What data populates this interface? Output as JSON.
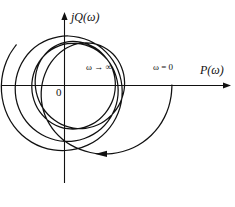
{
  "figure": {
    "kind": "nyquist-polar-plot",
    "background_color": "#ffffff",
    "stroke_color": "#111111"
  },
  "axes": {
    "imaginary": {
      "label": "jQ(ω)",
      "icon": "up-arrow-axis",
      "x_px": 64,
      "top_px": 12,
      "bottom_px": 183
    },
    "real": {
      "label": "P(ω)",
      "icon": "right-arrow-axis",
      "y_px": 85,
      "left_px": 2,
      "right_px": 230
    },
    "origin": {
      "label": "0",
      "x_px": 64,
      "y_px": 85
    }
  },
  "annotations": {
    "omega_start": "ω = 0",
    "omega_end": "ω → ∞",
    "direction_arrow": "left-pointing-arrowhead"
  },
  "chart_data": {
    "type": "line",
    "title": "",
    "xlabel": "P(ω)",
    "ylabel": "jQ(ω)",
    "grid": false,
    "legend": false,
    "curve_name": "nyquist-locus",
    "start_point_px": [
      172,
      85
    ],
    "end_point_px": [
      80,
      85
    ],
    "spiral": {
      "center_px": [
        64,
        85
      ],
      "start_radius_px": 108,
      "end_radius_px": 16,
      "start_angle_deg": 0,
      "total_sweep_deg": -720,
      "decay_per_turn": 0.385
    },
    "series": [
      {
        "name": "G(jω)",
        "points_px": [
          [
            172.0,
            85.0
          ],
          [
            171.1,
            96.2
          ],
          [
            168.6,
            107.1
          ],
          [
            164.4,
            117.4
          ],
          [
            158.6,
            126.9
          ],
          [
            151.3,
            135.2
          ],
          [
            142.8,
            142.2
          ],
          [
            133.2,
            147.7
          ],
          [
            122.8,
            151.5
          ],
          [
            112.0,
            153.6
          ],
          [
            101.0,
            153.9
          ],
          [
            90.3,
            152.5
          ],
          [
            80.1,
            149.4
          ],
          [
            70.6,
            144.9
          ],
          [
            62.2,
            139.0
          ],
          [
            55.0,
            131.9
          ],
          [
            49.3,
            123.9
          ],
          [
            45.0,
            115.2
          ],
          [
            42.3,
            106.0
          ],
          [
            41.2,
            96.7
          ],
          [
            41.6,
            87.4
          ],
          [
            43.5,
            78.4
          ],
          [
            46.7,
            69.9
          ],
          [
            51.2,
            62.2
          ],
          [
            56.7,
            55.6
          ],
          [
            63.1,
            50.2
          ],
          [
            70.2,
            46.2
          ],
          [
            77.7,
            43.7
          ],
          [
            85.4,
            42.8
          ],
          [
            93.1,
            43.4
          ],
          [
            100.4,
            45.6
          ],
          [
            107.1,
            49.2
          ],
          [
            113.0,
            54.0
          ],
          [
            117.8,
            60.0
          ],
          [
            121.4,
            66.9
          ],
          [
            123.7,
            74.4
          ],
          [
            124.6,
            82.4
          ],
          [
            124.0,
            90.5
          ],
          [
            121.9,
            98.4
          ],
          [
            118.5,
            105.9
          ],
          [
            113.8,
            112.7
          ],
          [
            107.9,
            118.5
          ],
          [
            101.1,
            123.2
          ],
          [
            93.5,
            126.5
          ],
          [
            85.5,
            128.3
          ],
          [
            77.3,
            128.6
          ],
          [
            69.2,
            127.2
          ],
          [
            61.4,
            124.4
          ],
          [
            54.3,
            120.1
          ],
          [
            48.0,
            114.5
          ],
          [
            42.8,
            107.9
          ],
          [
            38.9,
            100.4
          ],
          [
            36.3,
            92.3
          ],
          [
            35.2,
            83.9
          ],
          [
            35.6,
            75.6
          ],
          [
            37.5,
            67.6
          ],
          [
            40.8,
            60.3
          ],
          [
            45.4,
            53.9
          ],
          [
            51.1,
            48.6
          ],
          [
            57.7,
            44.7
          ],
          [
            65.0,
            42.3
          ],
          [
            72.7,
            41.4
          ],
          [
            80.5,
            42.1
          ],
          [
            88.1,
            44.3
          ],
          [
            95.2,
            47.9
          ],
          [
            101.6,
            52.9
          ],
          [
            107.0,
            59.0
          ],
          [
            111.2,
            66.1
          ],
          [
            114.0,
            73.9
          ],
          [
            115.3,
            82.1
          ],
          [
            115.0,
            90.5
          ],
          [
            113.2,
            98.7
          ],
          [
            109.8,
            106.4
          ],
          [
            105.1,
            113.4
          ],
          [
            99.1,
            119.4
          ],
          [
            92.1,
            124.1
          ],
          [
            84.3,
            127.3
          ],
          [
            76.1,
            128.9
          ],
          [
            67.7,
            128.7
          ],
          [
            59.6,
            126.8
          ],
          [
            52.0,
            123.2
          ],
          [
            45.3,
            118.1
          ],
          [
            39.7,
            111.7
          ],
          [
            35.5,
            104.2
          ],
          [
            32.8,
            95.9
          ],
          [
            31.8,
            87.2
          ],
          [
            32.5,
            78.4
          ],
          [
            34.9,
            69.9
          ],
          [
            39.0,
            62.1
          ],
          [
            44.5,
            55.3
          ],
          [
            51.3,
            49.8
          ],
          [
            59.1,
            45.9
          ],
          [
            67.5,
            43.7
          ],
          [
            76.3,
            43.4
          ],
          [
            85.0,
            44.9
          ],
          [
            93.3,
            48.2
          ],
          [
            100.8,
            53.2
          ],
          [
            107.3,
            59.7
          ],
          [
            112.4,
            67.4
          ],
          [
            116.0,
            76.1
          ],
          [
            117.9,
            85.4
          ],
          [
            118.0,
            95.0
          ],
          [
            116.3,
            104.4
          ],
          [
            112.8,
            113.4
          ],
          [
            107.7,
            121.6
          ],
          [
            101.1,
            128.7
          ],
          [
            93.2,
            134.4
          ],
          [
            84.4,
            138.5
          ],
          [
            74.9,
            140.9
          ],
          [
            65.1,
            141.4
          ],
          [
            55.3,
            140.0
          ],
          [
            45.9,
            136.8
          ],
          [
            37.2,
            131.8
          ],
          [
            29.6,
            125.2
          ],
          [
            23.4,
            117.3
          ],
          [
            18.8,
            108.2
          ],
          [
            16.0,
            98.3
          ],
          [
            15.2,
            88.1
          ],
          [
            16.3,
            77.8
          ],
          [
            19.4,
            67.9
          ],
          [
            24.3,
            58.8
          ],
          [
            30.9,
            50.8
          ],
          [
            39.0,
            44.3
          ],
          [
            48.2,
            39.6
          ],
          [
            58.2,
            36.8
          ],
          [
            68.6,
            36.0
          ],
          [
            79.0,
            37.3
          ],
          [
            89.0,
            40.5
          ],
          [
            98.2,
            45.6
          ],
          [
            106.3,
            52.4
          ],
          [
            113.0,
            60.7
          ],
          [
            118.0,
            70.2
          ],
          [
            121.1,
            80.5
          ],
          [
            122.2,
            91.3
          ],
          [
            121.2,
            102.3
          ],
          [
            118.1,
            113.0
          ],
          [
            113.0,
            123.0
          ],
          [
            106.1,
            131.9
          ],
          [
            97.5,
            139.4
          ],
          [
            87.6,
            145.1
          ],
          [
            76.7,
            148.9
          ],
          [
            65.2,
            150.5
          ],
          [
            53.5,
            149.9
          ],
          [
            42.1,
            147.1
          ],
          [
            31.5,
            142.1
          ],
          [
            21.9,
            135.0
          ],
          [
            13.9,
            126.1
          ],
          [
            7.7,
            115.7
          ],
          [
            3.5,
            104.1
          ],
          [
            1.5,
            91.8
          ],
          [
            1.8,
            79.2
          ],
          [
            4.5,
            66.8
          ],
          [
            9.3,
            55.2
          ],
          [
            16.2,
            44.8
          ]
        ]
      }
    ]
  }
}
